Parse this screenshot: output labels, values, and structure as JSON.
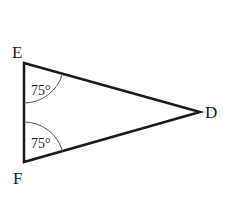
{
  "diagram": {
    "type": "triangle",
    "vertices": [
      {
        "label": "E",
        "x": 24,
        "y": 63
      },
      {
        "label": "F",
        "x": 24,
        "y": 162
      },
      {
        "label": "D",
        "x": 200,
        "y": 112
      }
    ],
    "angles": [
      {
        "vertex": "E",
        "label": "75°"
      },
      {
        "vertex": "F",
        "label": "75°"
      }
    ],
    "colors": {
      "stroke": "#1a1a1a",
      "arc": "#555555",
      "background": "#ffffff"
    }
  }
}
